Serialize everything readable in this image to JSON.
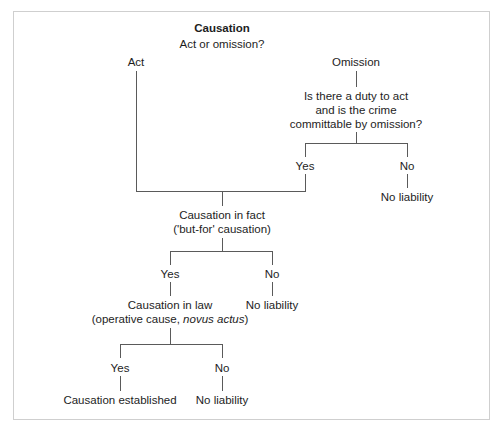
{
  "title": "Causation",
  "question": "Act or omission?",
  "branches": {
    "act": "Act",
    "omission": "Omission"
  },
  "omission_question": {
    "line1": "Is there a duty to act",
    "line2": "and is the crime",
    "line3": "committable by omission?",
    "yes": "Yes",
    "no": "No",
    "no_result": "No liability"
  },
  "causation_in_fact": {
    "line1": "Causation in fact",
    "line2": "('but-for' causation)",
    "yes": "Yes",
    "no": "No",
    "no_result": "No liability"
  },
  "causation_in_law": {
    "line1": "Causation in law",
    "line2_prefix": "(operative cause, ",
    "line2_italic": "novus actus",
    "line2_suffix": ")",
    "yes": "Yes",
    "no": "No",
    "yes_result": "Causation established",
    "no_result": "No liability"
  },
  "colors": {
    "line": "#5a5a5a",
    "text": "#1d1d1d",
    "frame": "#cfcfcf"
  }
}
